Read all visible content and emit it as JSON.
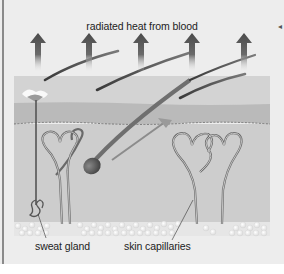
{
  "diagram": {
    "title": "radiated heat from blood",
    "labels": {
      "sweat_gland": "sweat gland",
      "skin_capillaries": "skin capillaries"
    },
    "arrow_count": 5,
    "colors": {
      "background": "#ededed",
      "surface_layer": "#d2d2d2",
      "epidermis": "#b9b9b9",
      "dermis": "#cdcdcd",
      "arrow": "#4a4a4a",
      "hair": "#5a5a5a",
      "fat_cells": "#f4f4f4",
      "border": "#8a8a8a"
    }
  }
}
